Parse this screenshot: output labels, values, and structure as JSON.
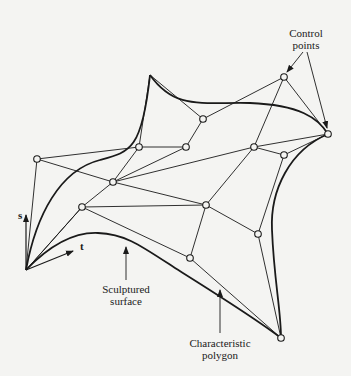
{
  "figure": {
    "labels": {
      "control_points": [
        "Control",
        "points"
      ],
      "sculptured_surface": [
        "Sculptured",
        "surface"
      ],
      "characteristic_polygon": [
        "Characteristic",
        "polygon"
      ],
      "axis_s": "s",
      "axis_t": "t"
    },
    "control_points": [
      {
        "id": "p0",
        "x": 37,
        "y": 159
      },
      {
        "id": "p1",
        "x": 139,
        "y": 147
      },
      {
        "id": "p2",
        "x": 186,
        "y": 147
      },
      {
        "id": "p3",
        "x": 203,
        "y": 119
      },
      {
        "id": "p4",
        "x": 284,
        "y": 77
      },
      {
        "id": "p5",
        "x": 328,
        "y": 134
      },
      {
        "id": "p6",
        "x": 113,
        "y": 182
      },
      {
        "id": "p7",
        "x": 254,
        "y": 147
      },
      {
        "id": "p8",
        "x": 284,
        "y": 155
      },
      {
        "id": "p9",
        "x": 82,
        "y": 207
      },
      {
        "id": "p10",
        "x": 206,
        "y": 205
      },
      {
        "id": "p11",
        "x": 258,
        "y": 234
      },
      {
        "id": "p12",
        "x": 190,
        "y": 258
      },
      {
        "id": "p13",
        "x": 281,
        "y": 338
      }
    ],
    "colors": {
      "ink": "#1a1a1a",
      "background": "#f4f4f2"
    }
  }
}
